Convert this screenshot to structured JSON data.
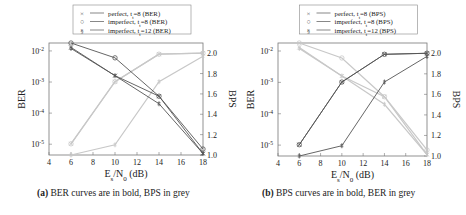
{
  "chart_data": [
    {
      "id": "a",
      "type": "line",
      "caption_label": "(a)",
      "caption_text": "BER curves are in bold, BPS in grey",
      "xlabel": "Es/N0 (dB)",
      "ylabel_left": "BER",
      "ylabel_right": "BPS",
      "x_ticks": [
        4,
        6,
        8,
        10,
        12,
        14,
        16,
        18
      ],
      "y_left_ticks": [
        "10^-2",
        "10^-3",
        "10^-4",
        "10^-5"
      ],
      "y_left_scale": "log",
      "y_right_ticks": [
        1.0,
        1.2,
        1.4,
        1.6,
        1.8,
        2.0
      ],
      "xlim": [
        4,
        18
      ],
      "ylim_left": [
        4.5e-06,
        0.018
      ],
      "ylim_right": [
        1.0,
        2.1
      ],
      "legend": [
        {
          "marker": "×",
          "label": "perfect, t_t=8 (BER)"
        },
        {
          "marker": "○",
          "label": "imperfect, t_t=8 (BER)"
        },
        {
          "marker": "§",
          "label": "imperfect, t_t=12 (BER)"
        }
      ],
      "x": [
        6,
        10,
        14,
        18
      ],
      "series": [
        {
          "name": "perfect, t_t=8 (BER)",
          "axis": "left",
          "style": "bold",
          "marker": "x",
          "values": [
            0.013,
            0.0016,
            0.00035,
            5e-06
          ]
        },
        {
          "name": "imperfect, t_t=8 (BER)",
          "axis": "left",
          "style": "bold",
          "marker": "o",
          "values": [
            0.018,
            0.006,
            0.00035,
            7e-06
          ]
        },
        {
          "name": "imperfect, t_t=12 (BER)",
          "axis": "left",
          "style": "bold",
          "marker": "s",
          "values": [
            0.012,
            0.0016,
            0.0002,
            5e-06
          ]
        },
        {
          "name": "perfect, t_t=8 (BPS)",
          "axis": "right",
          "style": "grey",
          "marker": "x",
          "values": [
            1.11,
            1.72,
            1.99,
            2.0
          ]
        },
        {
          "name": "imperfect, t_t=8 (BPS)",
          "axis": "right",
          "style": "grey",
          "marker": "o",
          "values": [
            1.11,
            1.72,
            1.99,
            2.0
          ]
        },
        {
          "name": "imperfect, t_t=12 (BPS)",
          "axis": "right",
          "style": "grey",
          "marker": "s",
          "values": [
            1.0,
            1.1,
            1.72,
            1.97
          ]
        }
      ],
      "grid": false,
      "legend_position": "top-center"
    },
    {
      "id": "b",
      "type": "line",
      "caption_label": "(b)",
      "caption_text": "BPS curves are in bold, BER in grey",
      "xlabel": "Es/N0 (dB)",
      "ylabel_left": "BER",
      "ylabel_right": "BPS",
      "x_ticks": [
        4,
        6,
        8,
        10,
        12,
        14,
        16,
        18
      ],
      "y_left_ticks": [
        "10^-2",
        "10^-3",
        "10^-4",
        "10^-5"
      ],
      "y_left_scale": "log",
      "y_right_ticks": [
        1.0,
        1.2,
        1.4,
        1.6,
        1.8,
        2.0
      ],
      "xlim": [
        4,
        18
      ],
      "ylim_left": [
        4.5e-06,
        0.018
      ],
      "ylim_right": [
        1.0,
        2.1
      ],
      "legend": [
        {
          "marker": "×",
          "label": "perfect, t_t=8 (BPS)"
        },
        {
          "marker": "○",
          "label": "imperfect, t_t=8 (BPS)"
        },
        {
          "marker": "§",
          "label": "imperfect, t_t=12 (BPS)"
        }
      ],
      "x": [
        6,
        10,
        14,
        18
      ],
      "series": [
        {
          "name": "perfect, t_t=8 (BPS)",
          "axis": "right",
          "style": "bold",
          "marker": "x",
          "values": [
            1.11,
            1.72,
            1.99,
            2.0
          ]
        },
        {
          "name": "imperfect, t_t=8 (BPS)",
          "axis": "right",
          "style": "bold",
          "marker": "o",
          "values": [
            1.11,
            1.72,
            1.99,
            2.0
          ]
        },
        {
          "name": "imperfect, t_t=12 (BPS)",
          "axis": "right",
          "style": "bold",
          "marker": "s",
          "values": [
            1.0,
            1.1,
            1.72,
            1.97
          ]
        },
        {
          "name": "perfect, t_t=8 (BER)",
          "axis": "left",
          "style": "grey",
          "marker": "x",
          "values": [
            0.013,
            0.0016,
            0.00035,
            5e-06
          ]
        },
        {
          "name": "imperfect, t_t=8 (BER)",
          "axis": "left",
          "style": "grey",
          "marker": "o",
          "values": [
            0.018,
            0.006,
            0.00035,
            7e-06
          ]
        },
        {
          "name": "imperfect, t_t=12 (BER)",
          "axis": "left",
          "style": "grey",
          "marker": "s",
          "values": [
            0.012,
            0.0016,
            0.0002,
            5e-06
          ]
        }
      ],
      "grid": false,
      "legend_position": "top-center"
    }
  ],
  "colors": {
    "bold": "#555555",
    "grey": "#c8c8c8",
    "axis": "#777777",
    "text": "#222222"
  }
}
